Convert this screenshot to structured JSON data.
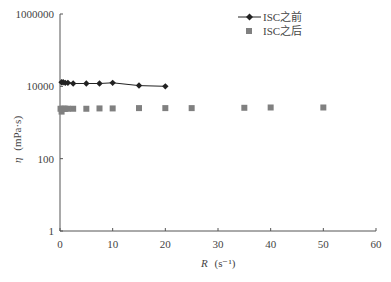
{
  "chart_data": {
    "type": "scatter",
    "title": "",
    "xlabel": "R (s⁻¹)",
    "xlabel_main": "R",
    "xlabel_unit": "(s⁻¹)",
    "ylabel": "η (mPa·s)",
    "ylabel_main": "η",
    "ylabel_unit": "(mPa·s)",
    "xlim": [
      0,
      60
    ],
    "ylim": [
      1,
      1000000
    ],
    "yscale": "log",
    "x_ticks": [
      0,
      10,
      20,
      30,
      40,
      50,
      60
    ],
    "x_tick_labels": [
      "0",
      "10",
      "20",
      "30",
      "40",
      "50",
      "60"
    ],
    "y_ticks": [
      1,
      100,
      10000,
      1000000
    ],
    "y_tick_labels": [
      "1",
      "100",
      "10000",
      "1000000"
    ],
    "grid": false,
    "legend_position": "top-right",
    "series": [
      {
        "name": "ISC之前",
        "marker": "diamond",
        "line": true,
        "color": "#222222",
        "x": [
          0.3,
          0.6,
          1,
          1.5,
          2.5,
          5,
          7.5,
          10,
          15,
          20
        ],
        "y": [
          13000,
          13000,
          12500,
          12500,
          12000,
          12000,
          12000,
          12500,
          10500,
          10000
        ]
      },
      {
        "name": "ISC之后",
        "marker": "square",
        "line": false,
        "color": "#808080",
        "x": [
          0.1,
          0.3,
          0.5,
          0.8,
          1,
          1.5,
          2.5,
          5,
          7.5,
          10,
          15,
          20,
          25,
          35,
          40,
          50
        ],
        "y": [
          2400,
          2000,
          2400,
          2400,
          2400,
          2400,
          2400,
          2400,
          2450,
          2450,
          2500,
          2500,
          2500,
          2550,
          2600,
          2600
        ]
      }
    ]
  },
  "legend": {
    "items": [
      {
        "label": "ISC之前"
      },
      {
        "label": "ISC之后"
      }
    ]
  }
}
